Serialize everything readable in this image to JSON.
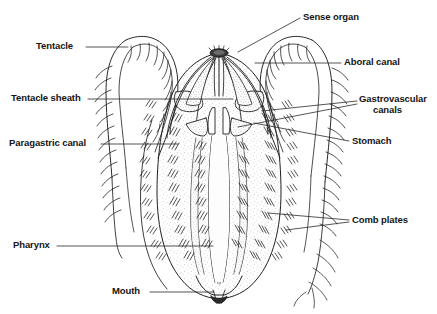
{
  "figure": {
    "background_color": "#ffffff",
    "ink_color": "#1a1a1a",
    "fill_color": "#f4f2ee",
    "stipple_color": "#8c8c8c"
  },
  "labels": {
    "tentacle": "Tentacle",
    "tentacle_sheath": "Tentacle sheath",
    "paragastric_canal": "Paragastric canal",
    "pharynx": "Pharynx",
    "mouth": "Mouth",
    "sense_organ": "Sense organ",
    "aboral_canal": "Aboral canal",
    "gastrovascular_canals_line1": "Gastrovascular",
    "gastrovascular_canals_line2": "canals",
    "stomach": "Stomach",
    "comb_plates": "Comb plates"
  },
  "label_list": [
    {
      "id": "tentacle",
      "text": "Tentacle",
      "side": "left",
      "x": 36,
      "y": 40
    },
    {
      "id": "tentacle-sheath",
      "text": "Tentacle sheath",
      "side": "left",
      "x": 12,
      "y": 92
    },
    {
      "id": "paragastric-canal",
      "text": "Paragastric canal",
      "side": "left",
      "x": 10,
      "y": 137
    },
    {
      "id": "pharynx",
      "text": "Pharynx",
      "side": "left",
      "x": 14,
      "y": 239
    },
    {
      "id": "mouth",
      "text": "Mouth",
      "side": "left",
      "x": 113,
      "y": 286
    },
    {
      "id": "sense-organ",
      "text": "Sense organ",
      "side": "right",
      "x": 303,
      "y": 11
    },
    {
      "id": "aboral-canal",
      "text": "Aboral canal",
      "side": "right",
      "x": 344,
      "y": 56
    },
    {
      "id": "gastrovascular-canals",
      "text": "Gastrovascular canals",
      "side": "right",
      "x": 360,
      "y": 94
    },
    {
      "id": "stomach",
      "text": "Stomach",
      "side": "right",
      "x": 352,
      "y": 135
    },
    {
      "id": "comb-plates",
      "text": "Comb plates",
      "side": "right",
      "x": 352,
      "y": 214
    }
  ],
  "leaders": [
    {
      "id": "tentacle",
      "points": "86,47 128,47"
    },
    {
      "id": "tentacle-sheath",
      "points": "88,99 152,99 232,99"
    },
    {
      "id": "paragastric-canal",
      "points": "101,144 176,144"
    },
    {
      "id": "pharynx",
      "points": "57,246 212,246"
    },
    {
      "id": "mouth",
      "points": "150,292 213,292"
    },
    {
      "id": "sense-organ",
      "points": "300,18 238,52"
    },
    {
      "id": "aboral-canal",
      "points": "341,63 255,63"
    },
    {
      "id": "gastrovascular-1",
      "points": "357,101 264,110"
    },
    {
      "id": "gastrovascular-2",
      "points": "357,104 238,126"
    },
    {
      "id": "stomach",
      "points": "349,141 255,123"
    },
    {
      "id": "comb-plates-1",
      "points": "349,220 268,214"
    },
    {
      "id": "comb-plates-2",
      "points": "349,222 286,229"
    }
  ],
  "anatomy_parts": [
    "body-outline",
    "left-tentacle",
    "right-tentacle",
    "left-tentacle-sheath",
    "right-tentacle-sheath",
    "stomach",
    "pharynx",
    "mouth",
    "sense-organ",
    "aboral-canal",
    "gastrovascular-canals",
    "paragastric-canals",
    "comb-plate-rows"
  ]
}
